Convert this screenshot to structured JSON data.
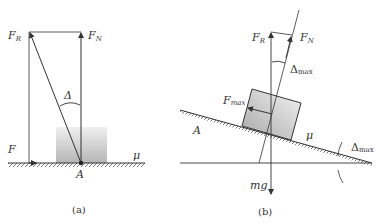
{
  "figure_a": {
    "caption": "(a)",
    "labels": {
      "resultant_force": {
        "main": "F",
        "sub": "R"
      },
      "normal_force": {
        "main": "F",
        "sub": "N"
      },
      "angle": "Δ",
      "applied_force": "F",
      "friction_coefficient": "μ",
      "point": "A"
    }
  },
  "figure_b": {
    "caption": "(b)",
    "labels": {
      "resultant_force": {
        "main": "F",
        "sub": "R"
      },
      "normal_force": {
        "main": "F",
        "sub": "N"
      },
      "angle_top": {
        "main": "Δ",
        "sub": "max"
      },
      "max_friction": {
        "main": "F",
        "sub": "max"
      },
      "point": "A",
      "friction_coefficient": "μ",
      "incline_angle": {
        "main": "Δ",
        "sub": "max"
      },
      "weight": "mg"
    }
  },
  "colors": {
    "line": "#333333",
    "shade_dark": "#b8b8b8",
    "shade_light": "#ececec"
  }
}
